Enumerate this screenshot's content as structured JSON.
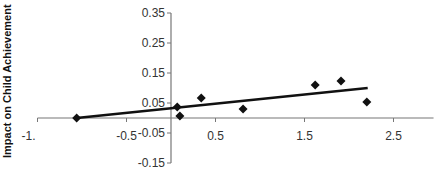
{
  "chart_data": {
    "type": "scatter",
    "title": "",
    "xlabel": "",
    "ylabel": "Impact on Child Achievement",
    "xlim": [
      -1.5,
      2.95
    ],
    "ylim": [
      -0.15,
      0.35
    ],
    "x_ticks": [
      -1.5,
      -0.5,
      0.5,
      1.5,
      2.5
    ],
    "x_tick_labels": [
      "-1.",
      "-0.5",
      "0.5",
      "1.5",
      "2.5"
    ],
    "y_ticks": [
      0.35,
      0.25,
      0.15,
      0.05,
      -0.05,
      -0.15
    ],
    "y_tick_labels": [
      "0.35",
      "0.25",
      "0.15",
      "0.05",
      "-0.05",
      "-0.15"
    ],
    "grid": false,
    "legend": null,
    "series": [
      {
        "name": "observations",
        "marker": "diamond",
        "color": "#111111",
        "points": [
          {
            "x": -1.06,
            "y": 0.0
          },
          {
            "x": 0.07,
            "y": 0.037
          },
          {
            "x": 0.1,
            "y": 0.007
          },
          {
            "x": 0.34,
            "y": 0.067
          },
          {
            "x": 0.81,
            "y": 0.03
          },
          {
            "x": 1.62,
            "y": 0.11
          },
          {
            "x": 1.91,
            "y": 0.123
          },
          {
            "x": 2.2,
            "y": 0.053
          }
        ]
      }
    ],
    "trend_line": {
      "name": "fitted-line",
      "color": "#111111",
      "from": {
        "x": -1.06,
        "y": 0.0
      },
      "to": {
        "x": 2.21,
        "y": 0.1
      }
    }
  }
}
